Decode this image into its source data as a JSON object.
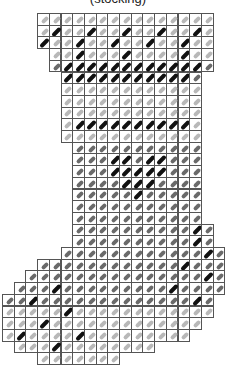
{
  "caption": "(stocking)",
  "pattern": {
    "title": "Needlepoint stocking chart",
    "origin": [
      2,
      13
    ],
    "cell": 11.7,
    "colors": {
      "grid": "#555555",
      "light": "#b8b8b8",
      "mid": "#6a6a6a",
      "dark": "#111111"
    },
    "rows": [
      {
        "from": 3,
        "to": 17,
        "fill": "light",
        "dark": []
      },
      {
        "from": 3,
        "to": 17,
        "fill": "light",
        "dark": [
          4,
          7,
          10,
          13,
          16
        ]
      },
      {
        "from": 3,
        "to": 17,
        "fill": "light",
        "dark": [
          3,
          6,
          9,
          12,
          15
        ]
      },
      {
        "from": 4,
        "to": 17,
        "fill": "light",
        "dark": [
          6,
          10,
          15
        ]
      },
      {
        "from": 4,
        "to": 17,
        "fill": "mid",
        "dark": [
          5,
          6,
          7,
          8,
          9,
          10,
          11,
          12,
          13,
          14,
          15,
          16
        ]
      },
      {
        "from": 5,
        "to": 16,
        "fill": "mid",
        "dark": [
          5,
          6,
          7,
          8,
          9,
          10,
          11,
          12,
          13,
          14,
          15
        ]
      },
      {
        "from": 5,
        "to": 16,
        "fill": "light",
        "dark": []
      },
      {
        "from": 5,
        "to": 16,
        "fill": "light",
        "dark": []
      },
      {
        "from": 5,
        "to": 16,
        "fill": "light",
        "dark": []
      },
      {
        "from": 5,
        "to": 16,
        "fill": "light",
        "dark": [
          6,
          7,
          8,
          9,
          10,
          11,
          12,
          13,
          14,
          15
        ]
      },
      {
        "from": 5,
        "to": 16,
        "fill": "light",
        "dark": []
      },
      {
        "from": 6,
        "to": 16,
        "fill": "mid",
        "dark": []
      },
      {
        "from": 6,
        "to": 16,
        "fill": "mid",
        "dark": [
          9,
          10,
          12,
          13
        ]
      },
      {
        "from": 6,
        "to": 16,
        "fill": "mid",
        "dark": [
          9,
          10,
          11,
          12,
          13
        ]
      },
      {
        "from": 6,
        "to": 16,
        "fill": "mid",
        "dark": [
          10,
          11,
          12
        ]
      },
      {
        "from": 6,
        "to": 16,
        "fill": "mid",
        "dark": [
          11
        ]
      },
      {
        "from": 6,
        "to": 16,
        "fill": "mid",
        "dark": []
      },
      {
        "from": 6,
        "to": 16,
        "fill": "mid",
        "dark": []
      },
      {
        "from": 6,
        "to": 17,
        "fill": "mid",
        "dark": [
          16
        ]
      },
      {
        "from": 6,
        "to": 17,
        "fill": "mid",
        "dark": [
          16
        ]
      },
      {
        "from": 5,
        "to": 18,
        "fill": "mid",
        "dark": [
          17
        ]
      },
      {
        "from": 3,
        "to": 18,
        "fill": "mid",
        "dark": [
          15
        ]
      },
      {
        "from": 2,
        "to": 18,
        "fill": "mid",
        "dark": [
          17
        ]
      },
      {
        "from": 1,
        "to": 18,
        "fill": "mid",
        "dark": [
          4,
          14
        ]
      },
      {
        "from": 0,
        "to": 17,
        "fill": "mid",
        "dark": [
          2,
          16
        ]
      },
      {
        "from": 0,
        "to": 17,
        "fill": "light",
        "dark": [
          5
        ]
      },
      {
        "from": 0,
        "to": 16,
        "fill": "light",
        "dark": [
          3
        ]
      },
      {
        "from": 0,
        "to": 15,
        "fill": "light",
        "dark": [
          1,
          6
        ]
      },
      {
        "from": 1,
        "to": 12,
        "fill": "light",
        "dark": [
          4
        ]
      },
      {
        "from": 3,
        "to": 9,
        "fill": "light",
        "dark": []
      }
    ]
  }
}
